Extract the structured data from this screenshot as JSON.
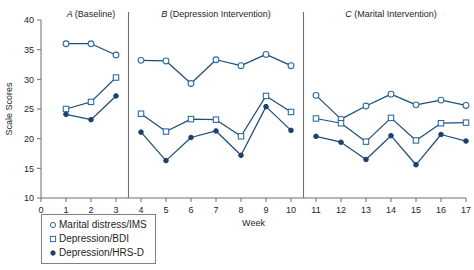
{
  "chart_data": {
    "type": "line",
    "title": "",
    "xlabel": "Week",
    "ylabel": "Scale Scores",
    "xlim": [
      0,
      17
    ],
    "ylim": [
      10,
      40
    ],
    "yticks": [
      10,
      15,
      20,
      25,
      30,
      35,
      40
    ],
    "xticks": [
      0,
      1,
      2,
      3,
      4,
      5,
      6,
      7,
      8,
      9,
      10,
      11,
      12,
      13,
      14,
      15,
      16,
      17
    ],
    "grid": false,
    "legend_position": "below-left",
    "panel_separators": [
      3.5,
      10.5
    ],
    "panels": [
      {
        "key": "A",
        "letter": "A",
        "name": "(Baseline)",
        "weeks": [
          1,
          2,
          3
        ]
      },
      {
        "key": "B",
        "letter": "B",
        "name": "(Depression Intervention)",
        "weeks": [
          4,
          5,
          6,
          7,
          8,
          9,
          10
        ]
      },
      {
        "key": "C",
        "letter": "C",
        "name": "(Marital Intervention)",
        "weeks": [
          11,
          12,
          13,
          14,
          15,
          16,
          17
        ]
      }
    ],
    "series": [
      {
        "name": "Marital distress/IMS",
        "marker": "open-circle",
        "segments": [
          {
            "panel": "A",
            "x": [
              1,
              2,
              3
            ],
            "values": [
              36.0,
              36.0,
              34.1
            ]
          },
          {
            "panel": "B",
            "x": [
              4,
              5,
              6,
              7,
              8,
              9,
              10
            ],
            "values": [
              33.2,
              33.1,
              29.3,
              33.3,
              32.3,
              34.2,
              32.3
            ]
          },
          {
            "panel": "C",
            "x": [
              11,
              12,
              13,
              14,
              15,
              16,
              17
            ],
            "values": [
              27.3,
              23.3,
              25.5,
              27.5,
              25.7,
              26.5,
              25.6
            ]
          }
        ]
      },
      {
        "name": "Depression/BDI",
        "marker": "open-square",
        "segments": [
          {
            "panel": "A",
            "x": [
              1,
              2,
              3
            ],
            "values": [
              25.0,
              26.2,
              30.3
            ]
          },
          {
            "panel": "B",
            "x": [
              4,
              5,
              6,
              7,
              8,
              9,
              10
            ],
            "values": [
              24.2,
              21.2,
              23.3,
              23.2,
              20.4,
              27.2,
              24.5
            ]
          },
          {
            "panel": "C",
            "x": [
              11,
              12,
              13,
              14,
              15,
              16,
              17
            ],
            "values": [
              23.4,
              22.6,
              19.5,
              23.5,
              19.7,
              22.6,
              22.7
            ]
          }
        ]
      },
      {
        "name": "Depression/HRS-D",
        "marker": "filled-circle",
        "segments": [
          {
            "panel": "A",
            "x": [
              1,
              2,
              3
            ],
            "values": [
              24.1,
              23.2,
              27.2
            ]
          },
          {
            "panel": "B",
            "x": [
              4,
              5,
              6,
              7,
              8,
              9,
              10
            ],
            "values": [
              21.1,
              16.3,
              20.2,
              21.3,
              17.2,
              25.4,
              21.4
            ]
          },
          {
            "panel": "C",
            "x": [
              11,
              12,
              13,
              14,
              15,
              16,
              17
            ],
            "values": [
              20.4,
              19.4,
              16.5,
              20.5,
              15.6,
              20.7,
              19.6
            ]
          }
        ]
      }
    ]
  },
  "legend": {
    "items": [
      {
        "label": "Marital distress/IMS",
        "marker": "open-circle"
      },
      {
        "label": "Depression/BDI",
        "marker": "open-square"
      },
      {
        "label": "Depression/HRS-D",
        "marker": "filled-circle"
      }
    ]
  },
  "colors": {
    "line": "#1f4e79",
    "marker_stroke": "#2e6ca4",
    "filled_marker": "#1f3f6e",
    "axis": "#6d6e71",
    "text": "#231f20",
    "background": "#ffffff"
  }
}
